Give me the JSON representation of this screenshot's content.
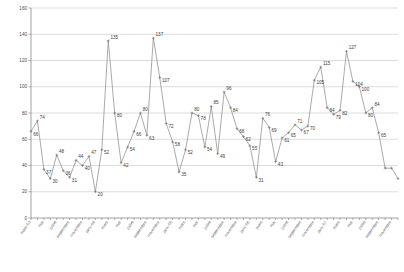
{
  "chart_data": {
    "type": "line",
    "title": "",
    "subtitle": "",
    "xlabel": "",
    "ylabel": "",
    "ylim": [
      0,
      160
    ],
    "yticks": [
      0,
      20,
      40,
      60,
      80,
      100,
      120,
      140,
      160
    ],
    "grid": true,
    "legend": false,
    "legend_position": "none",
    "show_data_labels": true,
    "marker": "cross",
    "line_color": "#8d8d8d",
    "grid_color": "#b8b8b8",
    "axis_color": "#7a7a7a",
    "x_tick_labels": [
      "mars-03",
      "mai",
      "juillet",
      "septembre",
      "novembre",
      "janv-04",
      "mars",
      "mai",
      "juillet",
      "septembre",
      "novembre",
      "janv-05",
      "mars",
      "mai",
      "juillet",
      "septembre",
      "novembre",
      "janv-06",
      "mars",
      "mai",
      "juillet",
      "septembre",
      "novembre",
      "janv-07",
      "mars",
      "mai",
      "juillet",
      "septembre",
      "novembre"
    ],
    "x_tick_every": 2,
    "values": [
      66,
      74,
      37,
      30,
      48,
      36,
      31,
      44,
      40,
      47,
      20,
      52,
      135,
      80,
      42,
      54,
      66,
      80,
      63,
      137,
      107,
      72,
      58,
      35,
      52,
      80,
      78,
      54,
      85,
      49,
      96,
      84,
      68,
      62,
      55,
      31,
      76,
      69,
      43,
      61,
      65,
      71,
      67,
      70,
      105,
      115,
      84,
      79,
      82,
      127,
      104,
      100,
      80,
      84,
      65,
      38,
      38,
      30
    ],
    "labels": [
      "66",
      "74",
      "37",
      "30",
      "48",
      "36",
      "31",
      "44",
      "40",
      "47",
      "20",
      "52",
      "135",
      "80",
      "42",
      "54",
      "66",
      "80",
      "63",
      "137",
      "107",
      "72",
      "58",
      "35",
      "52",
      "80",
      "78",
      "54",
      "85",
      "49",
      "96",
      "84",
      "68",
      "62",
      "55",
      "31",
      "76",
      "69",
      "43",
      "61",
      "65",
      "71",
      "67",
      "70",
      "105",
      "115",
      "84",
      "79",
      "82",
      "127",
      "104",
      "100",
      "80",
      "84",
      "65",
      "",
      "",
      ""
    ]
  }
}
